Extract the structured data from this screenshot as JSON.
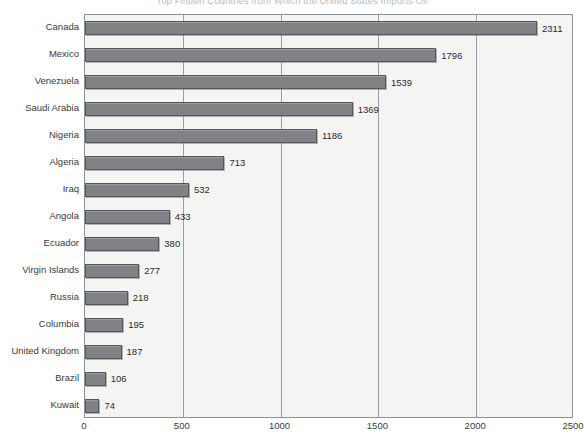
{
  "chart_data": {
    "type": "bar",
    "orientation": "horizontal",
    "title": "Top Fifteen Countries from Which the United States Imports Oil",
    "xlabel": "",
    "ylabel": "",
    "xlim": [
      0,
      2500
    ],
    "xticks": [
      0,
      500,
      1000,
      1500,
      2000,
      2500
    ],
    "gridlines": [
      500,
      1000,
      1500,
      2000
    ],
    "grid": true,
    "legend": false,
    "categories": [
      "Canada",
      "Mexico",
      "Venezuela",
      "Saudi Arabia",
      "Nigeria",
      "Algeria",
      "Iraq",
      "Angola",
      "Ecuador",
      "Virgin Islands",
      "Russia",
      "Columbia",
      "United Kingdom",
      "Brazil",
      "Kuwait"
    ],
    "values": [
      2311,
      1796,
      1539,
      1369,
      1186,
      713,
      532,
      433,
      380,
      277,
      218,
      195,
      187,
      106,
      74
    ],
    "data_labels": [
      "2311",
      "1796",
      "1539",
      "1369",
      "1186",
      "713",
      "532",
      "433",
      "380",
      "277",
      "218",
      "195",
      "187",
      "106",
      "74"
    ],
    "bar_color": "#808285",
    "bar_edge_color": "#55585b",
    "plot_background": "#f4f4f2",
    "axis_color": "#8d9094",
    "grid_color": "#9a9da1"
  },
  "caption": ""
}
